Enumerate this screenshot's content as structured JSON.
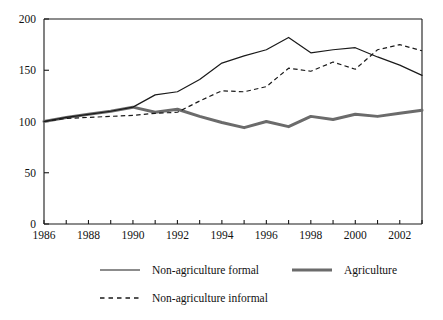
{
  "chart_data": {
    "type": "line",
    "title": "",
    "subtitle": "",
    "xlabel": "",
    "ylabel": "",
    "xlim": [
      1986,
      2003
    ],
    "ylim": [
      0,
      200
    ],
    "grid": false,
    "legend_position": "bottom",
    "x": [
      1986,
      1987,
      1988,
      1989,
      1990,
      1991,
      1992,
      1993,
      1994,
      1995,
      1996,
      1997,
      1998,
      1999,
      2000,
      2001,
      2002,
      2003
    ],
    "x_tick_labels": [
      "1986",
      "1988",
      "1990",
      "1992",
      "1994",
      "1996",
      "1998",
      "2000",
      "2002"
    ],
    "x_tick_values": [
      1986,
      1988,
      1990,
      1992,
      1994,
      1996,
      1998,
      2000,
      2002
    ],
    "y_tick_labels": [
      "0",
      "50",
      "100",
      "150",
      "200"
    ],
    "y_tick_values": [
      0,
      50,
      100,
      150,
      200
    ],
    "series": [
      {
        "name": "Non-agriculture formal",
        "style": "solid",
        "color": "#1a1a1a",
        "width": 1.2,
        "values": [
          100,
          104,
          107,
          110,
          114,
          126,
          129,
          141,
          157,
          164,
          170,
          182,
          167,
          170,
          172,
          163,
          155,
          145
        ]
      },
      {
        "name": "Non-agriculture informal",
        "style": "dashed",
        "color": "#1a1a1a",
        "width": 1.2,
        "values": [
          100,
          103,
          104,
          105,
          106,
          108,
          109,
          120,
          130,
          129,
          134,
          152,
          149,
          158,
          151,
          170,
          175,
          169
        ]
      },
      {
        "name": "Agriculture",
        "style": "thick",
        "color": "#6b6b6b",
        "width": 3.0,
        "values": [
          100,
          104,
          107,
          110,
          114,
          109,
          112,
          105,
          99,
          94,
          100,
          95,
          105,
          102,
          107,
          105,
          108,
          111
        ]
      }
    ]
  },
  "axes": {
    "y_ticks": [
      {
        "label": "200",
        "value": 200
      },
      {
        "label": "150",
        "value": 150
      },
      {
        "label": "100",
        "value": 100
      },
      {
        "label": "50",
        "value": 50
      },
      {
        "label": "0",
        "value": 0
      }
    ],
    "x_ticks": [
      {
        "label": "1986",
        "value": 1986
      },
      {
        "label": "1988",
        "value": 1988
      },
      {
        "label": "1990",
        "value": 1990
      },
      {
        "label": "1992",
        "value": 1992
      },
      {
        "label": "1994",
        "value": 1994
      },
      {
        "label": "1996",
        "value": 1996
      },
      {
        "label": "1998",
        "value": 1998
      },
      {
        "label": "2000",
        "value": 2000
      },
      {
        "label": "2002",
        "value": 2002
      }
    ]
  },
  "legend": {
    "entries": [
      {
        "label": "Non-agriculture formal",
        "style": "solid",
        "color": "#1a1a1a"
      },
      {
        "label": "Agriculture",
        "style": "thick",
        "color": "#6b6b6b"
      },
      {
        "label": "Non-agriculture informal",
        "style": "dashed",
        "color": "#1a1a1a"
      }
    ]
  },
  "colors": {
    "axis": "#1a1a1a",
    "formal": "#1a1a1a",
    "informal": "#1a1a1a",
    "agriculture": "#6b6b6b",
    "background": "#ffffff"
  }
}
